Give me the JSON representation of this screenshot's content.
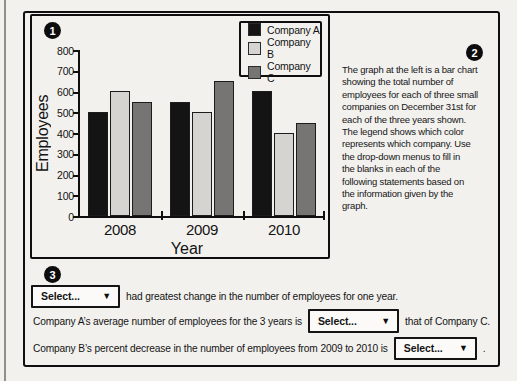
{
  "page": {
    "paper_color": "#f2f1ee",
    "border_color": "#0f0f0f",
    "badges": {
      "step1": "1",
      "step2": "2",
      "step3": "3"
    }
  },
  "icons": {
    "dropdown_arrow": "▼"
  },
  "chart_data": {
    "type": "bar",
    "categories": [
      "2008",
      "2009",
      "2010"
    ],
    "series": [
      {
        "name": "Company A",
        "color": "#141414",
        "values": [
          500,
          550,
          600
        ]
      },
      {
        "name": "Company B",
        "color": "#d5d4d1",
        "values": [
          600,
          500,
          400
        ]
      },
      {
        "name": "Company C",
        "color": "#767573",
        "values": [
          550,
          650,
          450
        ]
      }
    ],
    "title": "",
    "xlabel": "Year",
    "ylabel": "Employees",
    "ylim": [
      0,
      800
    ],
    "ytick_step": 100,
    "grid": false,
    "legend_position": "top-right"
  },
  "description": {
    "lines": [
      "The graph at the left is a bar chart",
      "showing the total number of",
      "employees for each of three small",
      "companies on December 31st for",
      "each of the three years shown.",
      "The legend shows which color",
      "represents which company. Use",
      "the drop-down menus to fill in",
      "the blanks in each of the",
      "following statements based on",
      "the information given by the",
      "graph."
    ]
  },
  "statements": [
    {
      "select_label": "Select...",
      "post": "had greatest change in the number of employees for one year."
    },
    {
      "pre": "Company A’s average number of employees for the 3 years is",
      "select_label": "Select...",
      "post": "that of Company C."
    },
    {
      "pre": "Company B’s percent decrease in the number of employees from 2009 to 2010 is",
      "select_label": "Select...",
      "post": "."
    }
  ]
}
